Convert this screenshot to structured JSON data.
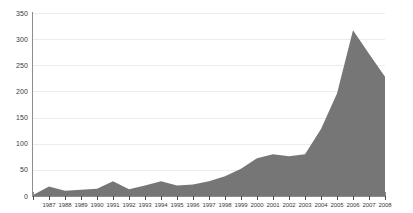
{
  "chart_data": {
    "type": "area",
    "title": "",
    "subtitle": "",
    "xlabel": "",
    "ylabel": "",
    "categories": [
      1986,
      1987,
      1988,
      1989,
      1990,
      1991,
      1992,
      1993,
      1994,
      1995,
      1996,
      1997,
      1998,
      1999,
      2000,
      2001,
      2002,
      2003,
      2004,
      2005,
      2006,
      2007,
      2008
    ],
    "values": [
      2,
      18,
      10,
      12,
      14,
      28,
      13,
      20,
      28,
      20,
      22,
      28,
      38,
      52,
      72,
      80,
      76,
      80,
      128,
      196,
      317,
      272,
      228
    ],
    "series": [
      {
        "name": "series-1",
        "values": [
          2,
          18,
          10,
          12,
          14,
          28,
          13,
          20,
          28,
          20,
          22,
          28,
          38,
          52,
          72,
          80,
          76,
          80,
          128,
          196,
          317,
          272,
          228
        ]
      }
    ],
    "xtick_labels": [
      "",
      "1987",
      "1988",
      "1989",
      "1990",
      "1991",
      "1992",
      "1993",
      "1994",
      "1995",
      "1996",
      "1997",
      "1998",
      "1999",
      "2000",
      "2001",
      "2002",
      "2003",
      "2004",
      "2005",
      "2006",
      "2007",
      "2008"
    ],
    "ytick_labels": [
      "0",
      "50",
      "100",
      "150",
      "200",
      "250",
      "300",
      "350"
    ],
    "ytick_values": [
      0,
      50,
      100,
      150,
      200,
      250,
      300,
      350
    ],
    "ylim": [
      0,
      350
    ],
    "xlim": [
      1986,
      2008
    ],
    "grid": true,
    "grid_axis": "y",
    "legend": false,
    "legend_position": "none",
    "colors": {
      "area_fill": "#767676",
      "gridline": "#ececed",
      "axis": "#8d8d8d",
      "tick": "#4a4a4a",
      "text": "#3b3b3b",
      "background": "#ffffff"
    }
  }
}
